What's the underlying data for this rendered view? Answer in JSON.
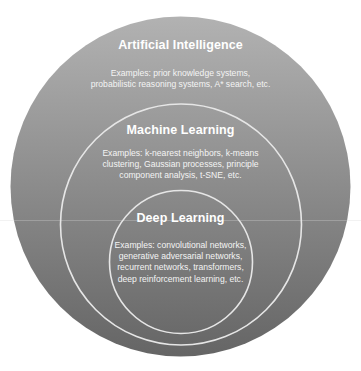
{
  "diagram": {
    "type": "nested-circles",
    "colors": {
      "gradient_top": "#b2b2b2",
      "gradient_bottom": "#656565",
      "ring_stroke": "#e6e6e6",
      "text": "#ffffff",
      "background": "#ffffff"
    },
    "circles": [
      {
        "id": "artificial-intelligence",
        "title": "Artificial Intelligence",
        "description_lines": [
          "Examples: prior knowledge systems,",
          "probabilistic reasoning systems, A* search, etc."
        ]
      },
      {
        "id": "machine-learning",
        "title": "Machine Learning",
        "description_lines": [
          "Examples: k-nearest neighbors, k-means",
          "clustering, Gaussian processes, principle",
          "component analysis, t-SNE, etc."
        ]
      },
      {
        "id": "deep-learning",
        "title": "Deep Learning",
        "description_lines": [
          "Examples: convolutional networks,",
          "generative adversarial networks,",
          "recurrent networks, transformers,",
          "deep reinforcement learning, etc."
        ]
      }
    ]
  }
}
